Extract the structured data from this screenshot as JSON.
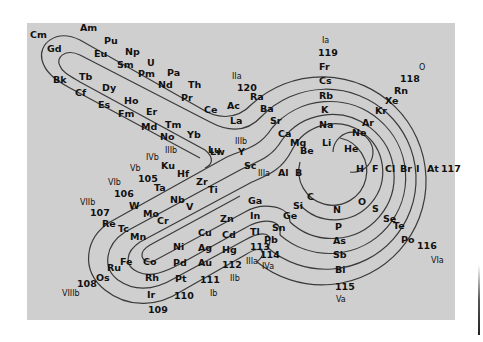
{
  "figure": {
    "background": "#cfcfcf",
    "line_color": "#3a3a3a"
  },
  "elements": [
    {
      "s": "Cm",
      "x": 30,
      "y": 38
    },
    {
      "s": "Am",
      "x": 80,
      "y": 31
    },
    {
      "s": "Gd",
      "x": 47,
      "y": 52
    },
    {
      "s": "Pu",
      "x": 104,
      "y": 44
    },
    {
      "s": "Eu",
      "x": 94,
      "y": 57
    },
    {
      "s": "Np",
      "x": 125,
      "y": 55
    },
    {
      "s": "Sm",
      "x": 117,
      "y": 68
    },
    {
      "s": "U",
      "x": 147,
      "y": 66
    },
    {
      "s": "Pm",
      "x": 138,
      "y": 77
    },
    {
      "s": "Pa",
      "x": 167,
      "y": 76
    },
    {
      "s": "Nd",
      "x": 158,
      "y": 88
    },
    {
      "s": "Th",
      "x": 188,
      "y": 88
    },
    {
      "s": "Pr",
      "x": 181,
      "y": 101
    },
    {
      "s": "Ce",
      "x": 204,
      "y": 113
    },
    {
      "s": "Ac",
      "x": 227,
      "y": 109
    },
    {
      "s": "La",
      "x": 230,
      "y": 124
    },
    {
      "s": "Ra",
      "x": 250,
      "y": 100
    },
    {
      "s": "Ba",
      "x": 260,
      "y": 112
    },
    {
      "s": "Sr",
      "x": 270,
      "y": 124
    },
    {
      "s": "Ca",
      "x": 278,
      "y": 137
    },
    {
      "s": "Mg",
      "x": 290,
      "y": 146
    },
    {
      "s": "Be",
      "x": 300,
      "y": 154
    },
    {
      "s": "Bk",
      "x": 53,
      "y": 83
    },
    {
      "s": "Tb",
      "x": 79,
      "y": 80
    },
    {
      "s": "Cf",
      "x": 75,
      "y": 96
    },
    {
      "s": "Dy",
      "x": 102,
      "y": 91
    },
    {
      "s": "Es",
      "x": 98,
      "y": 108
    },
    {
      "s": "Ho",
      "x": 124,
      "y": 104
    },
    {
      "s": "Fm",
      "x": 118,
      "y": 117
    },
    {
      "s": "Er",
      "x": 146,
      "y": 115
    },
    {
      "s": "Md",
      "x": 141,
      "y": 130
    },
    {
      "s": "Tm",
      "x": 165,
      "y": 128
    },
    {
      "s": "No",
      "x": 160,
      "y": 140
    },
    {
      "s": "Yb",
      "x": 187,
      "y": 138
    },
    {
      "s": "Lw",
      "x": 210,
      "y": 155
    },
    {
      "s": "Lu",
      "x": 208,
      "y": 153
    },
    {
      "s": "Y",
      "x": 238,
      "y": 155
    },
    {
      "s": "Sc",
      "x": 244,
      "y": 169
    },
    {
      "s": "Ku",
      "x": 161,
      "y": 169
    },
    {
      "s": "Hf",
      "x": 177,
      "y": 177
    },
    {
      "s": "Zr",
      "x": 196,
      "y": 185
    },
    {
      "s": "Ti",
      "x": 208,
      "y": 193
    },
    {
      "s": "105",
      "x": 138,
      "y": 182
    },
    {
      "s": "Ta",
      "x": 154,
      "y": 191
    },
    {
      "s": "Nb",
      "x": 170,
      "y": 203
    },
    {
      "s": "V",
      "x": 186,
      "y": 210
    },
    {
      "s": "106",
      "x": 114,
      "y": 197
    },
    {
      "s": "W",
      "x": 129,
      "y": 209
    },
    {
      "s": "Mo",
      "x": 143,
      "y": 217
    },
    {
      "s": "Cr",
      "x": 157,
      "y": 224
    },
    {
      "s": "107",
      "x": 90,
      "y": 216
    },
    {
      "s": "Re",
      "x": 102,
      "y": 227
    },
    {
      "s": "Tc",
      "x": 118,
      "y": 232
    },
    {
      "s": "Mn",
      "x": 130,
      "y": 240
    },
    {
      "s": "Fe",
      "x": 120,
      "y": 265
    },
    {
      "s": "Co",
      "x": 143,
      "y": 265
    },
    {
      "s": "Ni",
      "x": 173,
      "y": 250
    },
    {
      "s": "Cu",
      "x": 198,
      "y": 236
    },
    {
      "s": "Zn",
      "x": 220,
      "y": 222
    },
    {
      "s": "Ru",
      "x": 107,
      "y": 271
    },
    {
      "s": "Os",
      "x": 96,
      "y": 281
    },
    {
      "s": "Rh",
      "x": 145,
      "y": 281
    },
    {
      "s": "Pd",
      "x": 173,
      "y": 266
    },
    {
      "s": "Ag",
      "x": 198,
      "y": 251
    },
    {
      "s": "Cd",
      "x": 222,
      "y": 238
    },
    {
      "s": "Ir",
      "x": 147,
      "y": 298
    },
    {
      "s": "Pt",
      "x": 175,
      "y": 282
    },
    {
      "s": "Au",
      "x": 198,
      "y": 266
    },
    {
      "s": "Hg",
      "x": 222,
      "y": 253
    },
    {
      "s": "108",
      "x": 77,
      "y": 287
    },
    {
      "s": "109",
      "x": 148,
      "y": 313
    },
    {
      "s": "110",
      "x": 174,
      "y": 299
    },
    {
      "s": "111",
      "x": 200,
      "y": 283
    },
    {
      "s": "112",
      "x": 222,
      "y": 268
    },
    {
      "s": "Ga",
      "x": 248,
      "y": 204
    },
    {
      "s": "In",
      "x": 250,
      "y": 219
    },
    {
      "s": "Tl",
      "x": 250,
      "y": 235
    },
    {
      "s": "113",
      "x": 250,
      "y": 250
    },
    {
      "s": "Pb",
      "x": 264,
      "y": 243
    },
    {
      "s": "114",
      "x": 260,
      "y": 258
    },
    {
      "s": "Si",
      "x": 293,
      "y": 209
    },
    {
      "s": "Ge",
      "x": 283,
      "y": 219
    },
    {
      "s": "Sn",
      "x": 272,
      "y": 231
    },
    {
      "s": "Al",
      "x": 278,
      "y": 176
    },
    {
      "s": "B",
      "x": 295,
      "y": 176
    },
    {
      "s": "C",
      "x": 307,
      "y": 200
    },
    {
      "s": "N",
      "x": 333,
      "y": 213
    },
    {
      "s": "P",
      "x": 335,
      "y": 230
    },
    {
      "s": "As",
      "x": 333,
      "y": 244
    },
    {
      "s": "Sb",
      "x": 333,
      "y": 258
    },
    {
      "s": "Bi",
      "x": 335,
      "y": 273
    },
    {
      "s": "115",
      "x": 335,
      "y": 290
    },
    {
      "s": "O",
      "x": 358,
      "y": 205
    },
    {
      "s": "S",
      "x": 372,
      "y": 212
    },
    {
      "s": "Se",
      "x": 383,
      "y": 222
    },
    {
      "s": "Te",
      "x": 393,
      "y": 229
    },
    {
      "s": "Po",
      "x": 401,
      "y": 243
    },
    {
      "s": "116",
      "x": 417,
      "y": 249
    },
    {
      "s": "H",
      "x": 356,
      "y": 172
    },
    {
      "s": "F",
      "x": 372,
      "y": 172
    },
    {
      "s": "Cl",
      "x": 385,
      "y": 172
    },
    {
      "s": "Br",
      "x": 400,
      "y": 172
    },
    {
      "s": "I",
      "x": 416,
      "y": 172
    },
    {
      "s": "At",
      "x": 427,
      "y": 172
    },
    {
      "s": "117",
      "x": 441,
      "y": 172
    },
    {
      "s": "He",
      "x": 344,
      "y": 152
    },
    {
      "s": "Ne",
      "x": 352,
      "y": 136
    },
    {
      "s": "Ar",
      "x": 362,
      "y": 126
    },
    {
      "s": "Kr",
      "x": 375,
      "y": 114
    },
    {
      "s": "Xe",
      "x": 385,
      "y": 104
    },
    {
      "s": "Rn",
      "x": 394,
      "y": 94
    },
    {
      "s": "118",
      "x": 400,
      "y": 82
    },
    {
      "s": "Li",
      "x": 322,
      "y": 146
    },
    {
      "s": "Na",
      "x": 319,
      "y": 128
    },
    {
      "s": "K",
      "x": 321,
      "y": 113
    },
    {
      "s": "Rb",
      "x": 319,
      "y": 99
    },
    {
      "s": "Cs",
      "x": 319,
      "y": 84
    },
    {
      "s": "Fr",
      "x": 319,
      "y": 70
    },
    {
      "s": "119",
      "x": 318,
      "y": 56
    },
    {
      "s": "120",
      "x": 237,
      "y": 91
    }
  ],
  "groups": [
    {
      "s": "Ia",
      "x": 322,
      "y": 43
    },
    {
      "s": "O",
      "x": 419,
      "y": 70
    },
    {
      "s": "IIa",
      "x": 232,
      "y": 79
    },
    {
      "s": "IIIb",
      "x": 235,
      "y": 144
    },
    {
      "s": "IIIa",
      "x": 258,
      "y": 176
    },
    {
      "s": "IIIb",
      "x": 165,
      "y": 153
    },
    {
      "s": "IVb",
      "x": 146,
      "y": 160
    },
    {
      "s": "Vb",
      "x": 130,
      "y": 171
    },
    {
      "s": "VIb",
      "x": 108,
      "y": 185
    },
    {
      "s": "VIIb",
      "x": 80,
      "y": 205
    },
    {
      "s": "VIIIb",
      "x": 62,
      "y": 296
    },
    {
      "s": "Ib",
      "x": 210,
      "y": 296
    },
    {
      "s": "IIb",
      "x": 230,
      "y": 281
    },
    {
      "s": "IIIa",
      "x": 246,
      "y": 264
    },
    {
      "s": "IVa",
      "x": 262,
      "y": 269
    },
    {
      "s": "Va",
      "x": 336,
      "y": 302
    },
    {
      "s": "VIa",
      "x": 431,
      "y": 263
    }
  ]
}
